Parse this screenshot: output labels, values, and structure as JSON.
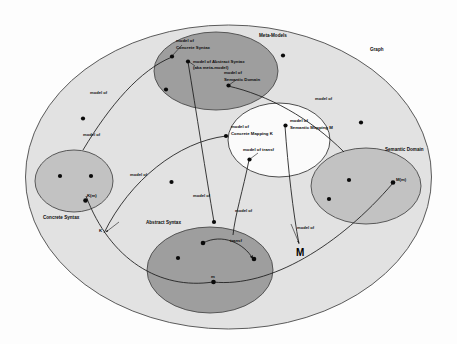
{
  "diagram": {
    "title": "Graph",
    "regions": [
      {
        "id": "graph",
        "label": "Graph"
      },
      {
        "id": "meta-models",
        "label": "Meta-Models"
      },
      {
        "id": "concrete-syntax",
        "label": "Concrete Syntax"
      },
      {
        "id": "abstract-syntax",
        "label": "Abstract Syntax"
      },
      {
        "id": "semantic-domain",
        "label": "Semantic Domain"
      },
      {
        "id": "mappings",
        "label": ""
      }
    ],
    "nodes": [
      {
        "id": "model-of-concrete-syntax",
        "label": "model of\nConcrete Syntax"
      },
      {
        "id": "model-of-abstract-syntax",
        "label": "model of Abstract Syntax\n(aka meta-model)"
      },
      {
        "id": "model-of-semantic-domain",
        "label": "model of\nSemantic Domain"
      },
      {
        "id": "model-of-concrete-mapping",
        "label": "model of\nConcrete Mapping K"
      },
      {
        "id": "model-of-semantic-mapping",
        "label": "model of\nSemantic Mapping M"
      },
      {
        "id": "model-of-transf",
        "label": "model of transf"
      },
      {
        "id": "km",
        "label": "K(m)"
      },
      {
        "id": "mm",
        "label": "M(m)"
      },
      {
        "id": "m",
        "label": "m"
      },
      {
        "id": "transf",
        "label": "transf"
      },
      {
        "id": "k-arrow",
        "label": "K"
      },
      {
        "id": "m-arrow",
        "label": "M"
      }
    ],
    "labels": {
      "meta_models": "Meta-Models",
      "graph": "Graph",
      "concrete_syntax": "Concrete Syntax",
      "abstract_syntax": "Abstract Syntax",
      "semantic_domain": "Semantic Domain",
      "model_of_concrete_syntax_l1": "model of",
      "model_of_concrete_syntax_l2": "Concrete Syntax",
      "model_of_abstract_syntax_l1": "model of Abstract Syntax",
      "model_of_abstract_syntax_l2": "(aka meta-model)",
      "model_of_semantic_domain_l1": "model of",
      "model_of_semantic_domain_l2": "Semantic Domain",
      "model_of_concrete_mapping_l1": "model of",
      "model_of_concrete_mapping_l2": "Concrete Mapping K",
      "model_of_semantic_mapping_l1": "model of",
      "model_of_semantic_mapping_l2": "Semantic Mapping M",
      "model_of_transf": "model of transf",
      "km": "K(m)",
      "mm": "M(m)",
      "m": "m",
      "transf": "transf",
      "k_arrow": "K",
      "m_arrow": "M",
      "edge_model_of_1": "model of",
      "edge_model_of_2": "model of",
      "edge_model_of_3": "model of",
      "edge_model_of_4": "model of",
      "edge_model_of_5": "model of",
      "edge_model_of_6": "model of",
      "edge_model_of_7": "model of"
    },
    "colors": {
      "outer_fill": "#e2e2e2",
      "mid_fill": "#c2c2c2",
      "dark_fill": "#9e9e9e",
      "white_fill": "#fbfbfb",
      "stroke": "#4a4a4a",
      "node": "#0a0a0a",
      "text": "#111111"
    }
  }
}
